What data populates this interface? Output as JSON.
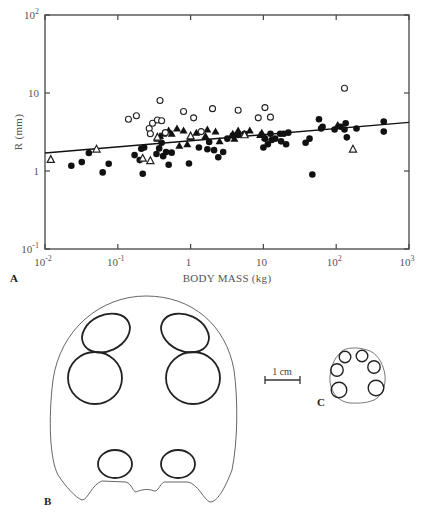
{
  "figure": {
    "panels": [
      {
        "id": "A",
        "label": "A"
      },
      {
        "id": "B",
        "label": "B"
      },
      {
        "id": "C",
        "label": "C"
      }
    ],
    "scale_bar": {
      "label": "1 cm"
    }
  },
  "chart_data": {
    "type": "scatter",
    "title": "",
    "xlabel": "BODY MASS (kg)",
    "ylabel": "R (mm)",
    "xscale": "log",
    "yscale": "log",
    "xlim": [
      0.01,
      1000
    ],
    "ylim": [
      0.1,
      100
    ],
    "grid": false,
    "legend": null,
    "x_ticks": [
      {
        "value": 0.01,
        "base": "10",
        "exp": "-2"
      },
      {
        "value": 0.1,
        "base": "10",
        "exp": "-1"
      },
      {
        "value": 1,
        "base": "1",
        "exp": ""
      },
      {
        "value": 10,
        "base": "10",
        "exp": ""
      },
      {
        "value": 100,
        "base": "10",
        "exp": "2"
      },
      {
        "value": 1000,
        "base": "10",
        "exp": "3"
      }
    ],
    "y_ticks": [
      {
        "value": 0.1,
        "base": "10",
        "exp": "-1"
      },
      {
        "value": 1,
        "base": "1",
        "exp": ""
      },
      {
        "value": 10,
        "base": "10",
        "exp": ""
      },
      {
        "value": 100,
        "base": "10",
        "exp": "2"
      }
    ],
    "regression_line": {
      "x": [
        0.01,
        1000
      ],
      "y": [
        1.7,
        4.2
      ]
    },
    "series": [
      {
        "name": "filled-circles",
        "marker": "filled-circle",
        "points": [
          [
            0.023,
            1.17
          ],
          [
            0.032,
            1.3
          ],
          [
            0.04,
            1.7
          ],
          [
            0.062,
            0.96
          ],
          [
            0.075,
            1.24
          ],
          [
            0.17,
            1.6
          ],
          [
            0.2,
            1.38
          ],
          [
            0.21,
            1.93
          ],
          [
            0.22,
            0.92
          ],
          [
            0.23,
            2.0
          ],
          [
            0.34,
            1.65
          ],
          [
            0.37,
            1.95
          ],
          [
            0.4,
            2.3
          ],
          [
            0.42,
            1.55
          ],
          [
            0.46,
            1.75
          ],
          [
            0.5,
            1.2
          ],
          [
            0.55,
            1.72
          ],
          [
            0.95,
            1.25
          ],
          [
            1.3,
            2.0
          ],
          [
            1.7,
            1.9
          ],
          [
            1.8,
            2.35
          ],
          [
            2.1,
            1.85
          ],
          [
            2.4,
            1.5
          ],
          [
            2.8,
            1.75
          ],
          [
            3.2,
            2.6
          ],
          [
            3.8,
            2.85
          ],
          [
            4.5,
            2.9
          ],
          [
            5.5,
            3.0
          ],
          [
            10.0,
            2.0
          ],
          [
            10.5,
            2.6
          ],
          [
            11.5,
            2.2
          ],
          [
            12.5,
            3.0
          ],
          [
            13,
            2.5
          ],
          [
            14.5,
            2.6
          ],
          [
            17,
            3.0
          ],
          [
            17.5,
            2.4
          ],
          [
            19,
            3.0
          ],
          [
            20.5,
            2.2
          ],
          [
            22,
            3.1
          ],
          [
            38,
            2.3
          ],
          [
            43,
            2.6
          ],
          [
            47,
            0.9
          ],
          [
            58,
            4.6
          ],
          [
            62,
            3.5
          ],
          [
            65,
            3.7
          ],
          [
            95,
            3.4
          ],
          [
            115,
            3.7
          ],
          [
            130,
            3.4
          ],
          [
            135,
            4.1
          ],
          [
            140,
            2.7
          ],
          [
            190,
            3.5
          ],
          [
            450,
            4.3
          ],
          [
            450,
            3.2
          ]
        ]
      },
      {
        "name": "filled-triangles",
        "marker": "filled-triangle",
        "points": [
          [
            0.35,
            2.6
          ],
          [
            0.38,
            2.8
          ],
          [
            0.42,
            3.0
          ],
          [
            0.5,
            3.3
          ],
          [
            0.55,
            3.0
          ],
          [
            0.65,
            3.5
          ],
          [
            0.7,
            2.1
          ],
          [
            0.8,
            3.3
          ],
          [
            0.9,
            2.2
          ],
          [
            1.0,
            2.7
          ],
          [
            1.2,
            3.1
          ],
          [
            1.6,
            2.8
          ],
          [
            1.7,
            3.4
          ],
          [
            2.2,
            3.2
          ],
          [
            2.5,
            2.4
          ],
          [
            3.8,
            3.0
          ],
          [
            4.0,
            2.6
          ],
          [
            4.5,
            3.3
          ],
          [
            6.5,
            3.3
          ],
          [
            9.0,
            2.9
          ],
          [
            9.5,
            3.1
          ],
          [
            10.5,
            2.7
          ],
          [
            105,
            3.9
          ]
        ]
      },
      {
        "name": "open-triangles",
        "marker": "open-triangle",
        "points": [
          [
            0.012,
            1.4
          ],
          [
            0.051,
            1.9
          ],
          [
            0.22,
            1.45
          ],
          [
            0.28,
            1.35
          ],
          [
            0.35,
            2.7
          ],
          [
            1.0,
            2.8
          ],
          [
            5.5,
            2.9
          ],
          [
            170,
            1.9
          ]
        ]
      },
      {
        "name": "open-circles",
        "marker": "open-circle",
        "points": [
          [
            0.14,
            4.6
          ],
          [
            0.18,
            5.1
          ],
          [
            0.27,
            3.5
          ],
          [
            0.28,
            3.0
          ],
          [
            0.3,
            4.1
          ],
          [
            0.35,
            4.5
          ],
          [
            0.38,
            8.0
          ],
          [
            0.4,
            4.4
          ],
          [
            0.45,
            3.1
          ],
          [
            0.8,
            5.8
          ],
          [
            1.1,
            4.8
          ],
          [
            1.4,
            3.2
          ],
          [
            2.0,
            6.3
          ],
          [
            4.5,
            6.0
          ],
          [
            8.5,
            4.8
          ],
          [
            10.5,
            6.5
          ],
          [
            12.5,
            4.9
          ],
          [
            130,
            11.5
          ]
        ]
      }
    ]
  }
}
